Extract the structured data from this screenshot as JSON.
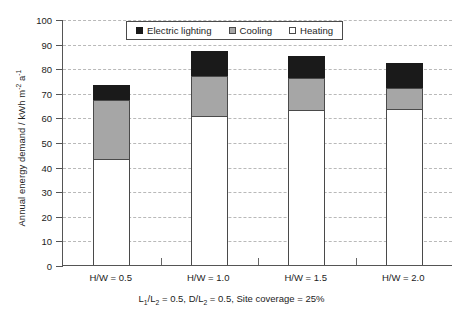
{
  "chart_data": {
    "type": "bar",
    "subtype": "stacked-vertical",
    "title": "",
    "xlabel": "L₁/L₂ = 0.5, D/L₂ = 0.5, Site coverage = 25%",
    "ylabel": "Annual energy demand / kWh m⁻² a⁻¹",
    "categories": [
      "H/W = 0.5",
      "H/W = 1.0",
      "H/W = 1.5",
      "H/W = 2.0"
    ],
    "series": [
      {
        "name": "Heating",
        "color": "#ffffff",
        "values": [
          43.0,
          60.5,
          63.0,
          63.5
        ]
      },
      {
        "name": "Cooling",
        "color": "#a6a6a6",
        "values": [
          24.0,
          16.5,
          13.0,
          8.5
        ]
      },
      {
        "name": "Electric lighting",
        "color": "#1a1a1a",
        "values": [
          6.0,
          10.0,
          9.0,
          10.0
        ]
      }
    ],
    "stack_order_bottom_to_top": [
      "Heating",
      "Cooling",
      "Electric lighting"
    ],
    "totals": [
      73.0,
      87.0,
      85.0,
      82.0
    ],
    "ylim": [
      0,
      100
    ],
    "yticks": [
      0,
      10,
      20,
      30,
      40,
      50,
      60,
      70,
      80,
      90,
      100
    ],
    "ytick_labels": [
      "0",
      "10",
      "20",
      "30",
      "40",
      "50",
      "60",
      "70",
      "80",
      "90",
      "100"
    ],
    "grid": "horizontal-dashed",
    "legend_position": "top-center-inside",
    "legend_entries": [
      "Electric lighting",
      "Cooling",
      "Heating"
    ]
  },
  "axis": {
    "y_title_main": "Annual energy demand / kWh m",
    "y_title_sup1": "-2",
    "y_title_mid": " a",
    "y_title_sup2": "-1"
  },
  "caption": {
    "part1": "L",
    "sub1": "1",
    "part2": "/L",
    "sub2": "2",
    "part3": " = 0.5, D/L",
    "sub3": "2",
    "part4": " = 0.5, Site coverage = 25%"
  },
  "colors": {
    "lighting": "#1a1a1a",
    "cooling": "#a6a6a6",
    "heating": "#ffffff",
    "axis": "#555555",
    "grid": "#b9b9b9",
    "text": "#1c1c1c"
  }
}
